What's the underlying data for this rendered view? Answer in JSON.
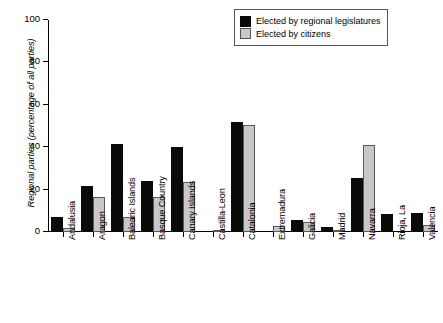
{
  "chart_data": {
    "type": "bar",
    "title": "",
    "xlabel": "",
    "ylabel": "Regional parties (percentage of all parties)",
    "ylim": [
      0,
      100
    ],
    "yticks": [
      0,
      20,
      40,
      60,
      80,
      100
    ],
    "grid": false,
    "legend_position": "top-right",
    "categories": [
      "Andalusia",
      "Aragon",
      "Balearic Islands",
      "Basque Country",
      "Canary Islands",
      "Castilla-Leon",
      "Catalonia",
      "Extremadura",
      "Galicia",
      "Madrid",
      "Navarra",
      "Rioja, La",
      "Valencia"
    ],
    "series": [
      {
        "name": "Elected by regional legislatures",
        "color": "#0a0a0a",
        "values": [
          7,
          21.5,
          41.5,
          24,
          40,
          0,
          52,
          0,
          5.5,
          2.5,
          25.5,
          8.5,
          9
        ]
      },
      {
        "name": "Elected by citizens",
        "color": "#c8c8c8",
        "values": [
          2,
          16.5,
          7,
          16.5,
          23.5,
          0.4,
          50.5,
          3,
          4.5,
          0.4,
          41,
          0,
          3.5
        ]
      }
    ]
  },
  "legend": {
    "entries": [
      {
        "label": "Elected by regional legislatures",
        "swatch": "black-swatch-icon"
      },
      {
        "label": "Elected by citizens",
        "swatch": "grey-swatch-icon"
      }
    ]
  }
}
